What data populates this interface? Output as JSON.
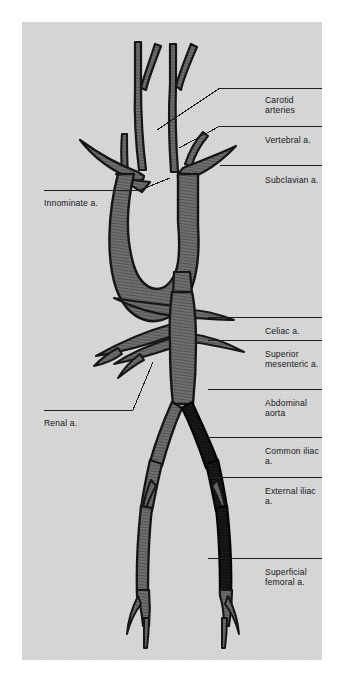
{
  "figure": {
    "panel_color": "#d8d8d8",
    "vessel_fill": "#6e6e6e",
    "vessel_dark": "#101010",
    "outline_color": "#111111",
    "label_color": "#15171a",
    "leader_color": "#1a1a1a"
  },
  "labels_right": [
    {
      "id": "carotid",
      "text": "Carotid arteries",
      "x": 243,
      "y": 73,
      "rule_y": 66,
      "rule_x1": 198,
      "rule_x2": 320,
      "leader": "135,108 198,66"
    },
    {
      "id": "vertebral",
      "text": "Vertebral a.",
      "x": 243,
      "y": 113,
      "rule_y": 104,
      "rule_x1": 198,
      "rule_x2": 320,
      "leader": "157,126 198,104"
    },
    {
      "id": "subclavian",
      "text": "Subclavian a.",
      "x": 243,
      "y": 153,
      "rule_y": 143,
      "rule_x1": 198,
      "rule_x2": 320,
      "leader": ""
    },
    {
      "id": "celiac",
      "text": "Celiac a.",
      "x": 243,
      "y": 304,
      "rule_y": 295,
      "rule_x1": 186,
      "rule_x2": 320,
      "leader": ""
    },
    {
      "id": "superior-mesenteric",
      "text": "Superior\nmesenteric a.",
      "x": 243,
      "y": 327,
      "rule_y": 318,
      "rule_x1": 186,
      "rule_x2": 320,
      "leader": ""
    },
    {
      "id": "abdominal-aorta",
      "text": "Abdominal aorta",
      "x": 243,
      "y": 376,
      "rule_y": 367,
      "rule_x1": 186,
      "rule_x2": 320,
      "leader": ""
    },
    {
      "id": "common-iliac",
      "text": "Common iliac a.",
      "x": 243,
      "y": 424,
      "rule_y": 415,
      "rule_x1": 186,
      "rule_x2": 320,
      "leader": ""
    },
    {
      "id": "external-iliac",
      "text": "External iliac a.",
      "x": 243,
      "y": 464,
      "rule_y": 455,
      "rule_x1": 186,
      "rule_x2": 320,
      "leader": ""
    },
    {
      "id": "superficial-femoral",
      "text": "Superficial\nfemoral a.",
      "x": 243,
      "y": 545,
      "rule_y": 536,
      "rule_x1": 186,
      "rule_x2": 320,
      "leader": ""
    }
  ],
  "labels_left": [
    {
      "id": "innominate",
      "text": "Innominate a.",
      "x": 22,
      "y": 176,
      "rule_y": 168,
      "rule_x1": 22,
      "rule_x2": 118,
      "leader": "118,168 148,156"
    },
    {
      "id": "renal",
      "text": "Renal a.",
      "x": 22,
      "y": 396,
      "rule_y": 388,
      "rule_x1": 22,
      "rule_x2": 111,
      "leader": "111,388 131,340"
    }
  ],
  "vessels": [
    {
      "id": "ascending-aorta",
      "name": "Ascending aorta",
      "shade": "mid"
    },
    {
      "id": "aortic-arch",
      "name": "Aortic arch",
      "shade": "mid"
    },
    {
      "id": "descending-thoracic",
      "name": "Descending thoracic aorta",
      "shade": "mid"
    },
    {
      "id": "abdominal-aorta-trunk",
      "name": "Abdominal aorta",
      "shade": "mid"
    },
    {
      "id": "innominate-trunk",
      "name": "Innominate artery",
      "shade": "mid"
    },
    {
      "id": "right-common-carotid",
      "name": "Right common carotid",
      "shade": "mid"
    },
    {
      "id": "left-common-carotid",
      "name": "Left common carotid",
      "shade": "mid"
    },
    {
      "id": "right-vertebral",
      "name": "Right vertebral artery",
      "shade": "mid"
    },
    {
      "id": "left-vertebral",
      "name": "Left vertebral artery",
      "shade": "mid"
    },
    {
      "id": "right-subclavian",
      "name": "Right subclavian artery",
      "shade": "mid"
    },
    {
      "id": "left-subclavian",
      "name": "Left subclavian artery",
      "shade": "mid"
    },
    {
      "id": "celiac-trunk",
      "name": "Celiac trunk",
      "shade": "mid"
    },
    {
      "id": "superior-mesenteric-a",
      "name": "Superior mesenteric artery",
      "shade": "mid"
    },
    {
      "id": "right-renal",
      "name": "Right renal artery",
      "shade": "mid"
    },
    {
      "id": "left-renal",
      "name": "Left renal artery",
      "shade": "mid"
    },
    {
      "id": "right-common-iliac",
      "name": "Right common iliac artery",
      "shade": "dark"
    },
    {
      "id": "left-common-iliac",
      "name": "Left common iliac artery",
      "shade": "mid"
    },
    {
      "id": "right-external-iliac",
      "name": "Right external iliac",
      "shade": "dark"
    },
    {
      "id": "left-external-iliac",
      "name": "Left external iliac",
      "shade": "mid"
    },
    {
      "id": "right-femoral",
      "name": "Right superficial femoral",
      "shade": "dark"
    },
    {
      "id": "left-femoral",
      "name": "Left superficial femoral",
      "shade": "mid"
    },
    {
      "id": "right-popliteal-fork",
      "name": "Right popliteal trifurcation",
      "shade": "mid"
    },
    {
      "id": "left-popliteal-fork",
      "name": "Left popliteal trifurcation",
      "shade": "mid"
    }
  ]
}
